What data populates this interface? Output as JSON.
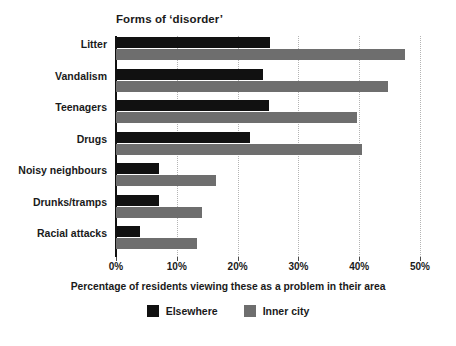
{
  "chart_data": {
    "type": "bar",
    "orientation": "horizontal",
    "title": "Forms of ‘disorder’",
    "xlabel": "Percentage of residents viewing these as a problem in their area",
    "ylabel": "",
    "xlim": [
      0,
      50
    ],
    "xticks": [
      0,
      10,
      20,
      30,
      40,
      50
    ],
    "xtick_labels": [
      "0%",
      "10%",
      "20%",
      "30%",
      "40%",
      "50%"
    ],
    "grid": "vertical-dotted",
    "legend_position": "bottom-center",
    "categories": [
      "Litter",
      "Vandalism",
      "Teenagers",
      "Drugs",
      "Noisy neighbours",
      "Drunks/tramps",
      "Racial attacks"
    ],
    "series": [
      {
        "name": "Elsewhere",
        "color": "#111111",
        "values": [
          25.3,
          24.1,
          25.1,
          22.0,
          7.0,
          7.1,
          3.9
        ]
      },
      {
        "name": "Inner city",
        "color": "#6e6e6e",
        "values": [
          47.6,
          44.8,
          39.6,
          40.5,
          16.4,
          14.1,
          13.3
        ]
      }
    ]
  },
  "colors": {
    "background": "#ffffff",
    "axis": "#111111",
    "gridline": "#b4b4b4",
    "text": "#1a1a1a",
    "elsewhere": "#111111",
    "inner_city": "#6e6e6e"
  }
}
